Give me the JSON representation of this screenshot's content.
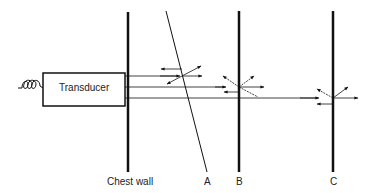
{
  "diagram": {
    "transducer_label": "Transducer",
    "labels": {
      "chest_wall": "Chest wall",
      "a": "A",
      "b": "B",
      "c": "C"
    },
    "colors": {
      "line": "#111111",
      "background": "#ffffff"
    }
  }
}
